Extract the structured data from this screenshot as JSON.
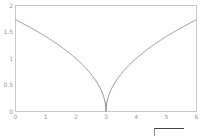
{
  "chart_data": {
    "type": "line",
    "title": "",
    "xlabel": "",
    "ylabel": "",
    "function": "sqrt(|x - 3|)",
    "xlim": [
      0,
      6
    ],
    "ylim": [
      0,
      2
    ],
    "x_ticks": [
      "0",
      "1",
      "2",
      "3",
      "4",
      "5",
      "6"
    ],
    "y_ticks": [
      "0",
      "0.5",
      "1",
      "1.5",
      "2"
    ],
    "grid": false,
    "legend": null,
    "series": [
      {
        "name": "y",
        "color": "#8c8c8c",
        "x": [
          0,
          0.5,
          1,
          1.5,
          2,
          2.5,
          2.75,
          2.9,
          2.97,
          3,
          3.03,
          3.1,
          3.25,
          3.5,
          4,
          4.5,
          5,
          5.5,
          6
        ],
        "y": [
          1.732,
          1.581,
          1.414,
          1.225,
          1.0,
          0.707,
          0.5,
          0.316,
          0.173,
          0,
          0.173,
          0.316,
          0.5,
          0.707,
          1.0,
          1.225,
          1.414,
          1.581,
          1.732
        ]
      }
    ]
  },
  "colors": {
    "frame": "#c8c8c8",
    "curve": "#8c8c8c",
    "tick_text": "#999999"
  }
}
